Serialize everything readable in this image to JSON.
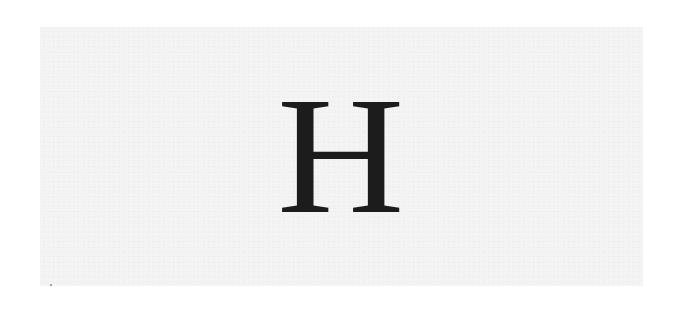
{
  "image": {
    "letter": "H",
    "colors": {
      "background": "#ffffff",
      "panel": "#f4f4f4",
      "glyph": "#1c1c1c"
    }
  }
}
